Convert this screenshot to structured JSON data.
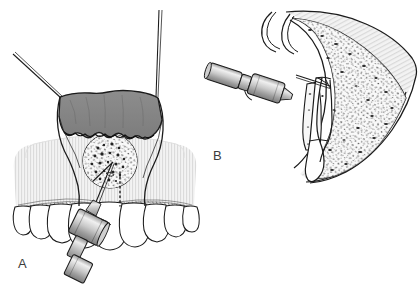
{
  "figure": {
    "background_color": "#ffffff",
    "width": 418,
    "height": 287,
    "style": "line-art medical illustration, grayscale"
  },
  "panels": [
    {
      "id": "A",
      "label": "A",
      "view": "frontal intraoral view",
      "description": "Mucoperiosteal flap reflected and retracted by sutures, exposing bony expansion over cystic lesion; aspirating needle inserted through bone into the lesion.",
      "elements": {
        "flap_label": "reflected mucoperiosteal flap",
        "lesion_label": "cystic lesion / bony window",
        "teeth_label": "maxillary anterior teeth",
        "syringe_label": "aspirating syringe",
        "needle_label": "aspiration needle",
        "suture_left_label": "retraction suture",
        "suture_right_label": "retraction suture",
        "dotted_line_label": "projected root apex line",
        "mucosa_label": "alveolar mucosa"
      }
    },
    {
      "id": "B",
      "label": "B",
      "view": "sagittal cross-section",
      "description": "Cross-section of the jaw showing needle penetrating cortical bone into the cyst cavity located above the root apex of the tooth.",
      "elements": {
        "bone_label": "trabecular (cancellous) bone",
        "cortex_label": "cortical bone margin",
        "cavity_label": "cyst cavity",
        "tooth_label": "tooth with root",
        "syringe_label": "aspirating syringe",
        "needle_label": "aspiration needle",
        "flap_label": "reflected flap in section"
      }
    }
  ],
  "colors": {
    "ink": "#1b1b1b",
    "flap_gray": "#8a8a8a",
    "flap_gray_dark": "#6f6f6f",
    "mucosa_light": "#e9e9e9",
    "bone_light": "#ededed",
    "metal_light": "#dcdcdc",
    "metal_mid": "#b6b6b6",
    "metal_dark": "#8f8f8f",
    "speckle": "#2a2a2a",
    "tooth_white": "#ffffff",
    "label_color": "#3c3c3c",
    "background": "#ffffff"
  }
}
